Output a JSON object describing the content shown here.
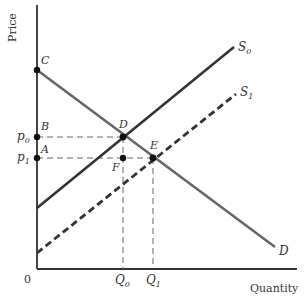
{
  "diagram": {
    "type": "supply-demand-shift",
    "axes": {
      "y_label": "Price",
      "x_label": "Quantity",
      "origin_label": "0"
    },
    "curves": {
      "demand": {
        "label": "D"
      },
      "supply_initial": {
        "label": "S",
        "subscript": "0"
      },
      "supply_shifted": {
        "label": "S",
        "subscript": "1"
      }
    },
    "points": {
      "C": "C",
      "B": "B",
      "A": "A",
      "D": "D",
      "E": "E",
      "F": "F"
    },
    "price_ticks": {
      "p0": {
        "label": "p",
        "subscript": "0"
      },
      "p1": {
        "label": "p",
        "subscript": "1"
      }
    },
    "quantity_ticks": {
      "q0": {
        "label": "Q",
        "subscript": "0"
      },
      "q1": {
        "label": "Q",
        "subscript": "1"
      }
    },
    "colors": {
      "axis": "#333333",
      "demand": "#666666",
      "supply": "#333333",
      "guides": "#555555"
    }
  }
}
